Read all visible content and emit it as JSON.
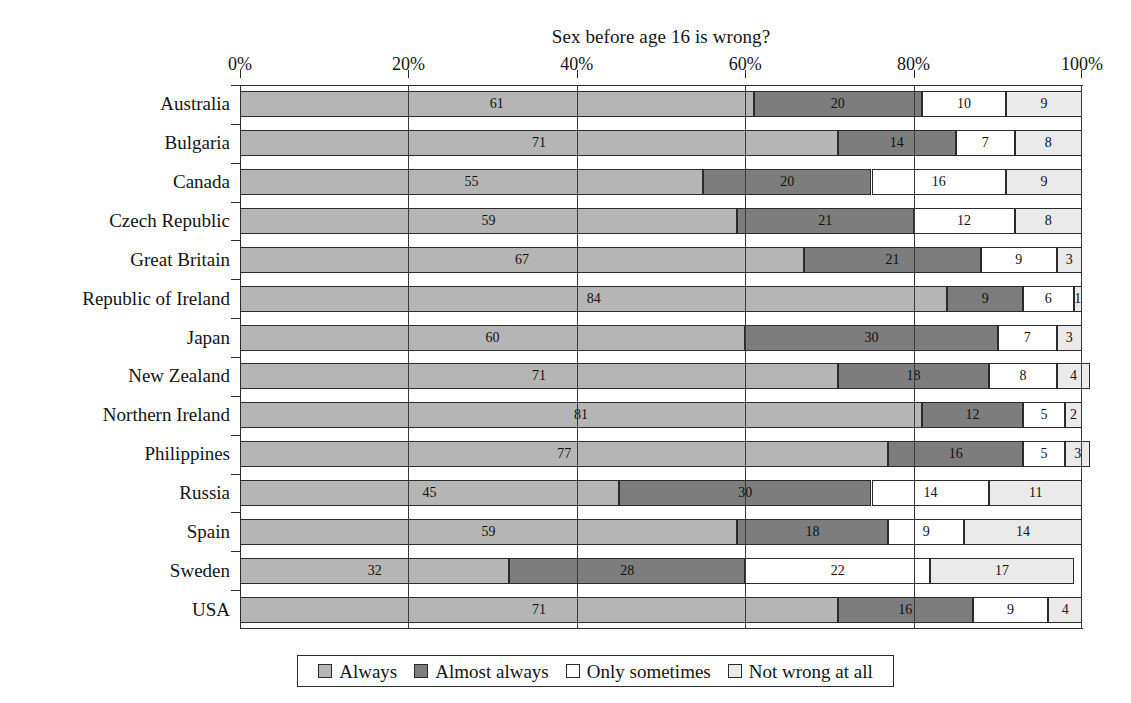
{
  "chart_data": {
    "type": "bar",
    "orientation": "horizontal",
    "stacked": true,
    "normalized_percent": true,
    "title": "Sex before age 16 is wrong?",
    "xlabel": "",
    "ylabel": "",
    "xlim": [
      0,
      100
    ],
    "xticks": [
      "0%",
      "20%",
      "40%",
      "60%",
      "80%",
      "100%"
    ],
    "xtick_values": [
      0,
      20,
      40,
      60,
      80,
      100
    ],
    "grid": true,
    "legend_position": "bottom",
    "categories": [
      "Australia",
      "Bulgaria",
      "Canada",
      "Czech Republic",
      "Great Britain",
      "Republic of Ireland",
      "Japan",
      "New Zealand",
      "Northern Ireland",
      "Philippines",
      "Russia",
      "Spain",
      "Sweden",
      "USA"
    ],
    "series": [
      {
        "name": "Always",
        "color": "#b5b5b5",
        "values": [
          61,
          71,
          55,
          59,
          67,
          84,
          60,
          71,
          81,
          77,
          45,
          59,
          32,
          71
        ]
      },
      {
        "name": "Almost always",
        "color": "#7d7d7d",
        "values": [
          20,
          14,
          20,
          21,
          21,
          9,
          30,
          18,
          12,
          16,
          30,
          18,
          28,
          16
        ]
      },
      {
        "name": "Only sometimes",
        "color": "#ffffff",
        "values": [
          10,
          7,
          16,
          12,
          9,
          6,
          7,
          8,
          5,
          5,
          14,
          9,
          22,
          9
        ]
      },
      {
        "name": "Not wrong at all",
        "color": "#eaeaea",
        "values": [
          9,
          8,
          9,
          8,
          3,
          1,
          3,
          4,
          2,
          3,
          11,
          14,
          17,
          4
        ]
      }
    ]
  },
  "legend": {
    "items": [
      {
        "label": "Always",
        "color": "#b5b5b5"
      },
      {
        "label": "Almost always",
        "color": "#7d7d7d"
      },
      {
        "label": "Only sometimes",
        "color": "#ffffff"
      },
      {
        "label": "Not wrong at all",
        "color": "#eaeaea"
      }
    ]
  }
}
